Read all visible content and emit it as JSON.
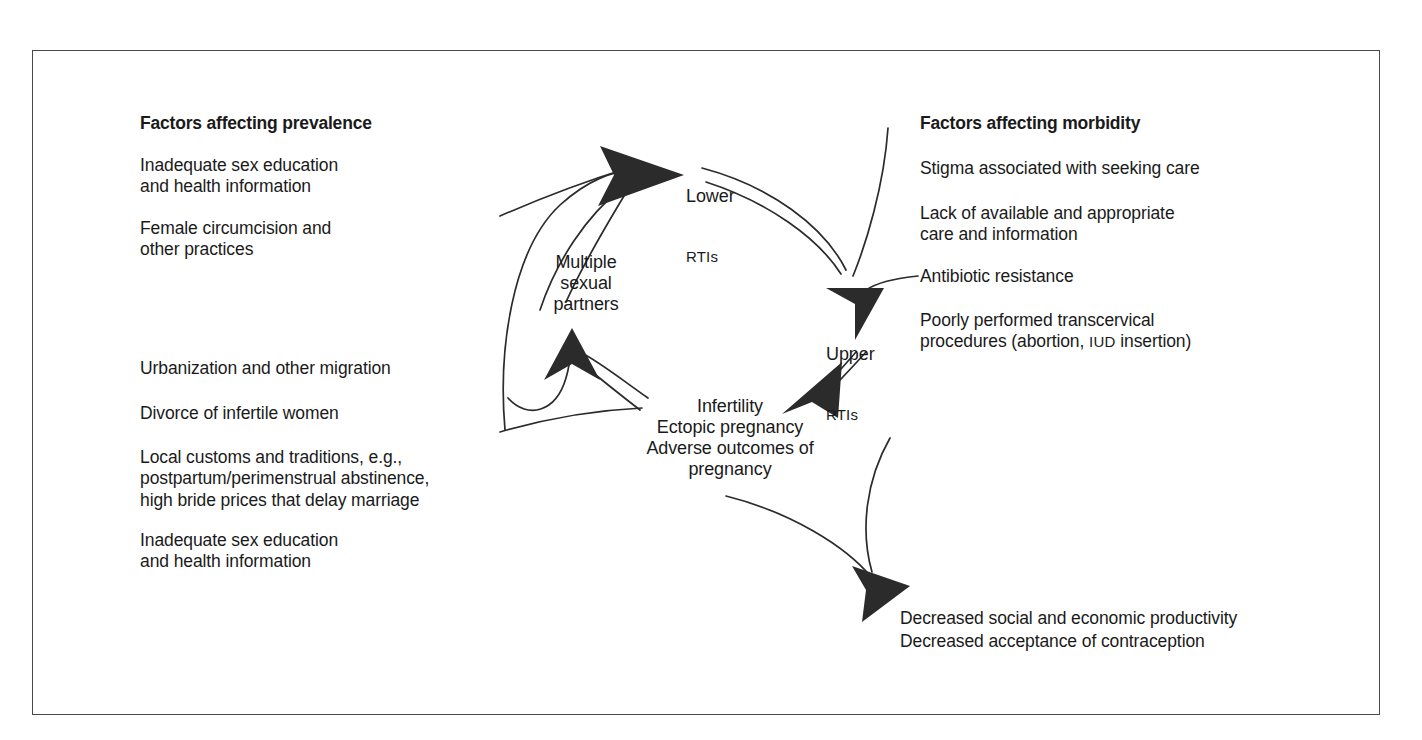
{
  "figure": {
    "frame_color": "#4a4a4a",
    "ink_color": "#1a1a1a",
    "arrow_color": "#2b2b2b"
  },
  "columns": {
    "left": {
      "heading": "Factors affecting prevalence",
      "items_top": [
        "Inadequate sex education\nand health information",
        "Female circumcision and\nother practices"
      ],
      "items_bottom": [
        "Urbanization and other migration",
        "Divorce of infertile women",
        "Local customs and traditions, e.g.,\npostpartum/perimenstrual abstinence,\nhigh bride prices that delay marriage",
        "Inadequate sex education\nand health information"
      ]
    },
    "right": {
      "heading": "Factors affecting morbidity",
      "items": [
        "Stigma associated with seeking care",
        "Lack of available and appropriate\ncare and information",
        "Antibiotic resistance",
        "Poorly performed transcervical"
      ],
      "item_4_line2_prefix": "procedures (abortion, ",
      "item_4_line2_smallcaps": "IUD",
      "item_4_line2_suffix": " insertion)"
    }
  },
  "cycle": {
    "lower_rtis": {
      "line1": "Lower",
      "line2": "RTIs"
    },
    "upper_rtis": {
      "line1": "Upper",
      "line2": "RTIs"
    },
    "multiple_partners": "Multiple\nsexual\npartners",
    "outcomes_pregnancy": "Infertility\nEctopic pregnancy\nAdverse outcomes of\npregnancy"
  },
  "outcome_box": {
    "line1": "Decreased social and economic productivity",
    "line2": "Decreased acceptance of contraception"
  }
}
